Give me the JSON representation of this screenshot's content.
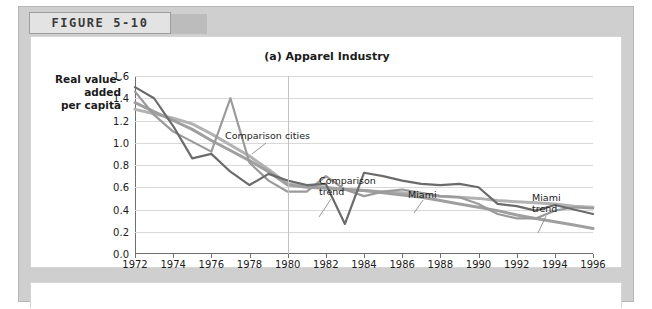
{
  "figure": {
    "tab_label": "FIGURE 5-10"
  },
  "chart_data": {
    "type": "line",
    "title": "(a) Apparel Industry",
    "xlabel": "",
    "ylabel": "Real value-added per capita",
    "ylabel_lines": [
      "Real value-",
      "added",
      "per capita"
    ],
    "xlim": [
      1972,
      1996
    ],
    "ylim": [
      0.0,
      1.6
    ],
    "ytick_labels": [
      "0.0",
      "0.2",
      "0.4",
      "0.6",
      "0.8",
      "1.0",
      "1.2",
      "1.4",
      "1.6"
    ],
    "ytick_values": [
      0.0,
      0.2,
      0.4,
      0.6,
      0.8,
      1.0,
      1.2,
      1.4,
      1.6
    ],
    "xtick_labels": [
      "1972",
      "1974",
      "1976",
      "1978",
      "1980",
      "1982",
      "1984",
      "1986",
      "1988",
      "1990",
      "1992",
      "1994",
      "1996"
    ],
    "xtick_values": [
      1972,
      1974,
      1976,
      1978,
      1980,
      1982,
      1984,
      1986,
      1988,
      1990,
      1992,
      1994,
      1996
    ],
    "grid": true,
    "legend_position": "inline-annotations",
    "reference_line": {
      "x": 1980,
      "color": "#c2c2c2",
      "label": ""
    },
    "x": [
      1972,
      1973,
      1974,
      1975,
      1976,
      1977,
      1978,
      1979,
      1980,
      1981,
      1982,
      1983,
      1984,
      1985,
      1986,
      1987,
      1988,
      1989,
      1990,
      1991,
      1992,
      1993,
      1994,
      1995,
      1996
    ],
    "series": [
      {
        "name": "Miami",
        "color": "#6b6b6b",
        "width": 2.2,
        "values": [
          1.5,
          1.4,
          1.15,
          0.86,
          0.9,
          0.74,
          0.62,
          0.72,
          0.66,
          0.62,
          0.63,
          0.27,
          0.73,
          0.7,
          0.66,
          0.63,
          0.62,
          0.63,
          0.6,
          0.45,
          0.43,
          0.39,
          0.44,
          0.4,
          0.36
        ]
      },
      {
        "name": "Comparison cities",
        "color": "#9a9a9a",
        "width": 2.2,
        "values": [
          1.46,
          1.25,
          1.1,
          1.01,
          0.92,
          1.4,
          0.82,
          0.66,
          0.56,
          0.56,
          0.7,
          0.58,
          0.52,
          0.56,
          0.58,
          0.55,
          0.52,
          0.51,
          0.45,
          0.36,
          0.32,
          0.32,
          0.39,
          0.42,
          0.41
        ]
      },
      {
        "name": "Comparison trend",
        "color": "#b2b2b2",
        "width": 3.0,
        "values": [
          1.3,
          1.26,
          1.22,
          1.17,
          1.08,
          0.98,
          0.88,
          0.76,
          0.63,
          0.61,
          0.6,
          0.58,
          0.57,
          0.56,
          0.55,
          0.54,
          0.52,
          0.51,
          0.5,
          0.48,
          0.47,
          0.46,
          0.45,
          0.43,
          0.42
        ]
      },
      {
        "name": "Miami trend",
        "color": "#9f9f9f",
        "width": 3.0,
        "values": [
          1.36,
          1.28,
          1.2,
          1.12,
          1.02,
          0.93,
          0.84,
          0.74,
          0.62,
          0.6,
          0.59,
          0.58,
          0.57,
          0.55,
          0.53,
          0.51,
          0.48,
          0.45,
          0.42,
          0.39,
          0.35,
          0.32,
          0.29,
          0.26,
          0.23
        ]
      }
    ],
    "annotations": [
      {
        "text": "Comparison cities",
        "x_px": 194,
        "y_px": 93,
        "leader": [
          [
            235,
            106
          ],
          [
            221,
            117
          ]
        ]
      },
      {
        "text": "Comparison\ntrend",
        "x_px": 288,
        "y_px": 138,
        "leader": [
          [
            300,
            162
          ],
          [
            288,
            180
          ]
        ]
      },
      {
        "text": "Miami",
        "x_px": 377,
        "y_px": 152,
        "leader": [
          [
            392,
            163
          ],
          [
            383,
            176
          ]
        ]
      },
      {
        "text": "Miami\ntrend",
        "x_px": 501,
        "y_px": 155,
        "leader": [
          [
            515,
            179
          ],
          [
            507,
            196
          ]
        ]
      }
    ]
  }
}
